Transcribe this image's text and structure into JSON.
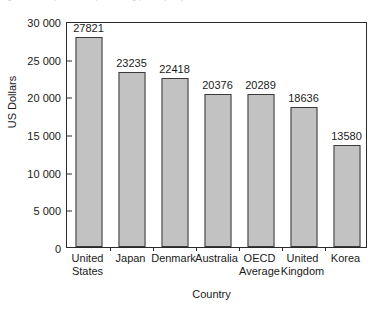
{
  "chart_data": {
    "type": "bar",
    "title": "",
    "xlabel": "Country",
    "ylabel": "US Dollars",
    "categories": [
      "United States",
      "Japan",
      "Denmark",
      "Australia",
      "OECD Average",
      "United Kingdom",
      "Korea"
    ],
    "values": [
      27821,
      23235,
      22418,
      20376,
      20289,
      18636,
      13580
    ],
    "value_labels": [
      "27821",
      "23235",
      "22418",
      "20376",
      "20289",
      "18636",
      "13580"
    ],
    "ylim": [
      0,
      30000
    ],
    "ytick_values": [
      0,
      5000,
      10000,
      15000,
      20000,
      25000,
      30000
    ],
    "ytick_labels": [
      "0",
      "5 000",
      "10 000",
      "15 000",
      "20 000",
      "25 000",
      "30 000"
    ],
    "grid": false,
    "legend": false,
    "legend_position": "none",
    "bar_color": "#c2c2c2",
    "bar_edge_color": "#3a3a3a",
    "axis_color": "#2a2a2a",
    "background_color": "#ffffff"
  },
  "category_lines": [
    [
      "United",
      "States"
    ],
    [
      "Japan"
    ],
    [
      "Denmark"
    ],
    [
      "Australia"
    ],
    [
      "OECD",
      "Average"
    ],
    [
      "United",
      "Kingdom"
    ],
    [
      "Korea"
    ]
  ],
  "caption_remnant": "figures are expressed in purchasing power parity"
}
